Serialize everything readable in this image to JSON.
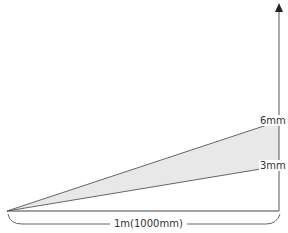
{
  "diagram": {
    "type": "angle-spread",
    "labels": {
      "upper_offset": "6mm",
      "lower_offset": "3mm",
      "distance": "1m(1000mm)"
    },
    "colors": {
      "line": "#555555",
      "fill": "#e8e8e8",
      "text": "#333333"
    }
  }
}
